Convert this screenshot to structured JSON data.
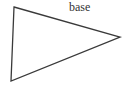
{
  "diagram": {
    "type": "triangle",
    "stroke_color": "#3a3a3a",
    "stroke_width": 1.3,
    "vertices": [
      {
        "name": "top-left",
        "x": 14,
        "y": 7
      },
      {
        "name": "right",
        "x": 120,
        "y": 37
      },
      {
        "name": "bottom-left",
        "x": 11,
        "y": 81
      }
    ],
    "labels": [
      {
        "text": "base",
        "x": 69,
        "y": 1
      }
    ]
  }
}
